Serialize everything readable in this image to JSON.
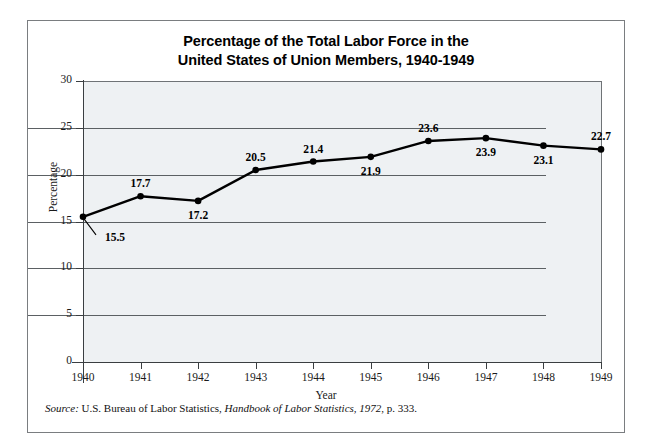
{
  "figure": {
    "title_line_1": "Percentage of the Total Labor Force in the",
    "title_line_2": "United States of Union Members, 1940-1949",
    "source_prefix": "Source:",
    "source_text_1": " U.S. Bureau of Labor Statistics, ",
    "source_italic": "Handbook of Labor Statistics, 1972",
    "source_text_2": ", p. 333.",
    "background_color": "#eef1f3",
    "line_color": "#000000",
    "frame_color": "#7a7d80"
  },
  "chart_data": {
    "type": "line",
    "title": "Percentage of the Total Labor Force in the United States of Union Members, 1940-1949",
    "xlabel": "Year",
    "ylabel": "Percentage",
    "categories": [
      "1940",
      "1941",
      "1942",
      "1943",
      "1944",
      "1945",
      "1946",
      "1947",
      "1948",
      "1949"
    ],
    "values": [
      15.5,
      17.7,
      17.2,
      20.5,
      21.4,
      21.9,
      23.6,
      23.9,
      23.1,
      22.7
    ],
    "point_labels": [
      "15.5",
      "17.7",
      "17.2",
      "20.5",
      "21.4",
      "21.9",
      "23.6",
      "23.9",
      "23.1",
      "22.7"
    ],
    "label_positions": [
      "leader-below-left",
      "above",
      "below",
      "above",
      "above",
      "below",
      "above",
      "below",
      "below",
      "above"
    ],
    "ylim": [
      0,
      30
    ],
    "yticks": [
      0,
      5,
      10,
      15,
      20,
      25,
      30
    ],
    "ytick_labels": [
      "0",
      "5",
      "10",
      "15",
      "20",
      "25",
      "30"
    ],
    "xlim": [
      "1940",
      "1949"
    ],
    "grid": "horizontal",
    "legend": "none",
    "marker": "filled-circle"
  }
}
